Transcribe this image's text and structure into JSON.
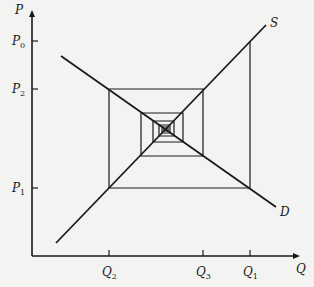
{
  "figure": {
    "type": "cobweb-model",
    "axes": {
      "y_label": "P",
      "x_label": "Q",
      "origin": [
        32,
        256
      ],
      "y_top": 10,
      "x_right": 300
    },
    "y_ticks": [
      {
        "base": "P",
        "sub": "0",
        "y": 41
      },
      {
        "base": "P",
        "sub": "2",
        "y": 89
      },
      {
        "base": "P",
        "sub": "1",
        "y": 188
      }
    ],
    "x_ticks": [
      {
        "base": "Q",
        "sub": "2",
        "x": 109
      },
      {
        "base": "Q",
        "sub": "3",
        "x": 203
      },
      {
        "base": "Q",
        "sub": "1",
        "x": 250
      }
    ],
    "curves": {
      "supply": {
        "label": "S",
        "from": [
          56,
          243
        ],
        "to": [
          266,
          25
        ]
      },
      "demand": {
        "label": "D",
        "from": [
          61,
          56
        ],
        "to": [
          276,
          207
        ]
      }
    },
    "cobweb_path": [
      [
        250,
        41
      ],
      [
        250,
        188
      ],
      [
        109,
        188
      ],
      [
        109,
        89
      ],
      [
        203,
        89
      ],
      [
        203,
        156
      ],
      [
        141,
        156
      ],
      [
        141,
        113
      ],
      [
        183,
        113
      ],
      [
        183,
        142
      ],
      [
        153,
        142
      ],
      [
        153,
        121
      ],
      [
        174,
        121
      ],
      [
        174,
        136
      ],
      [
        159,
        136
      ],
      [
        159,
        125
      ],
      [
        170,
        125
      ],
      [
        170,
        133
      ],
      [
        162,
        133
      ],
      [
        162,
        127
      ],
      [
        168,
        127
      ],
      [
        168,
        131
      ],
      [
        164,
        131
      ],
      [
        164,
        129
      ],
      [
        166,
        129
      ]
    ],
    "colors": {
      "line": "#1a1a1a",
      "background": "#f3f3f1"
    }
  }
}
